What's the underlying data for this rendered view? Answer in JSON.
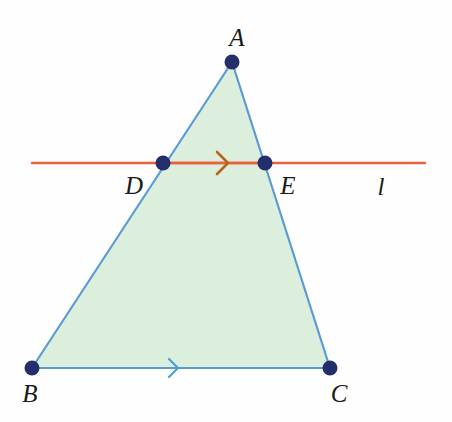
{
  "figure": {
    "canvas": {
      "width": 452,
      "height": 422,
      "background": "#fefefe"
    },
    "colors": {
      "triangle_fill": "#dcefdc",
      "triangle_stroke": "#5b9bd5",
      "point_fill": "#232f6b",
      "transversal_line": "#e8603c",
      "de_arrow": "#b5651d",
      "bc_arrow": "#4a9fd4",
      "label_text": "#1a1a1a"
    },
    "points": [
      {
        "id": "A",
        "label": "A",
        "x": 232,
        "y": 62,
        "label_x": 237,
        "label_y": 37,
        "radius": 7
      },
      {
        "id": "B",
        "label": "B",
        "x": 32,
        "y": 368,
        "label_x": 30,
        "label_y": 393,
        "radius": 7
      },
      {
        "id": "C",
        "label": "C",
        "x": 330,
        "y": 368,
        "label_x": 339,
        "label_y": 393,
        "radius": 7
      },
      {
        "id": "D",
        "label": "D",
        "x": 163,
        "y": 163,
        "label_x": 134,
        "label_y": 185,
        "radius": 7
      },
      {
        "id": "E",
        "label": "E",
        "x": 265,
        "y": 163,
        "label_x": 288,
        "label_y": 185,
        "radius": 7
      }
    ],
    "triangle": {
      "name": "triangle-ABC",
      "vertices": "232,62 32,368 330,368",
      "stroke_width": 2.2
    },
    "transversal": {
      "name": "line-l",
      "label": "l",
      "x1": 32,
      "y1": 163,
      "x2": 425,
      "y2": 163,
      "stroke_width": 2.4,
      "label_x": 381,
      "label_y": 186
    },
    "segments": [
      {
        "id": "DE",
        "name": "segment-DE",
        "x1": 163,
        "y1": 163,
        "x2": 265,
        "y2": 163
      },
      {
        "id": "BC",
        "name": "segment-BC",
        "x1": 32,
        "y1": 368,
        "x2": 330,
        "y2": 368
      }
    ],
    "arrow_markers": [
      {
        "id": "arrow-DE",
        "on_segment": "DE",
        "x": 228,
        "y": 163,
        "size": 11,
        "color": "#b5651d",
        "stroke_width": 2.6,
        "direction": "right"
      },
      {
        "id": "arrow-BC",
        "on_segment": "BC",
        "x": 178,
        "y": 368,
        "size": 9,
        "color": "#4a9fd4",
        "stroke_width": 2.2,
        "direction": "right"
      }
    ]
  }
}
